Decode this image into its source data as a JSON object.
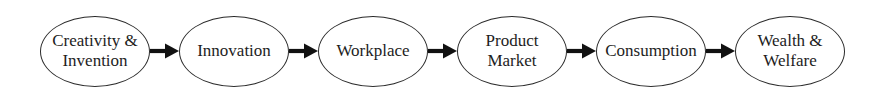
{
  "diagram": {
    "nodes": [
      {
        "label": "Creativity & Invention"
      },
      {
        "label": "Innovation"
      },
      {
        "label": "Workplace"
      },
      {
        "label": "Product Market"
      },
      {
        "label": "Consumption"
      },
      {
        "label": "Wealth & Welfare"
      }
    ],
    "colors": {
      "background": "#ffffff",
      "node_fill": "#ffffff",
      "node_stroke": "#2b2b2b",
      "text": "#1d1d1d",
      "arrow": "#111111"
    }
  }
}
